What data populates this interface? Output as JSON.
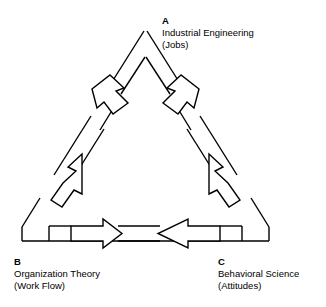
{
  "diagram": {
    "type": "triangle-cycle",
    "background_color": "#ffffff",
    "stroke_color": "#000000",
    "nodes": [
      {
        "id": "A",
        "letter": "A",
        "title": "Industrial Engineering",
        "subtitle": "(Jobs)",
        "position": "top"
      },
      {
        "id": "B",
        "letter": "B",
        "title": "Organization Theory",
        "subtitle": "(Work Flow)",
        "position": "bottom-left"
      },
      {
        "id": "C",
        "letter": "C",
        "title": "Behavioral Science",
        "subtitle": "(Attitudes)",
        "position": "bottom-right"
      }
    ],
    "edges": [
      {
        "id": "a-to-b",
        "from": "A",
        "to": "B",
        "direction": "down-left",
        "style": "broken-line-with-open-arrow"
      },
      {
        "id": "a-to-c",
        "from": "A",
        "to": "C",
        "direction": "down-right",
        "style": "broken-line-with-open-arrow"
      },
      {
        "id": "b-to-a",
        "from": "B",
        "to": "A",
        "direction": "up-right",
        "style": "broken-line-with-open-arrow"
      },
      {
        "id": "c-to-a",
        "from": "C",
        "to": "A",
        "direction": "up-left",
        "style": "broken-line-with-open-arrow"
      },
      {
        "id": "b-to-c",
        "from": "B",
        "to": "C",
        "direction": "right",
        "style": "broken-line-with-open-arrow"
      },
      {
        "id": "c-to-b",
        "from": "C",
        "to": "B",
        "direction": "left",
        "style": "broken-line-with-open-arrow"
      }
    ]
  }
}
